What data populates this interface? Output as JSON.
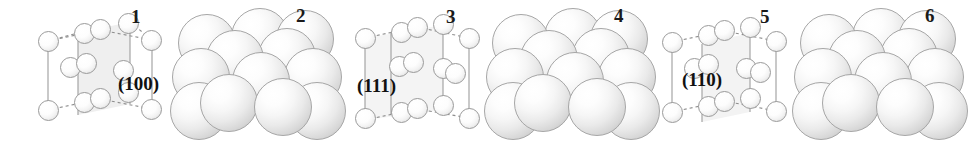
{
  "figure": {
    "background_color": "#ffffff",
    "width": 960,
    "height": 141
  },
  "style": {
    "atom_outline_color": "#9a9a9a",
    "sphere_outline_color": "#a6a6a6",
    "edge_solid_color": "#9d9d9d",
    "edge_dashed_color": "#8e8e8e",
    "plane_fill_color": "#e8e8e8",
    "label_color": "#1a1a1a"
  },
  "panels": [
    {
      "number": "1",
      "type": "ball-and-stick",
      "miller_label": "(100)",
      "label_x": 131,
      "label_y": 7,
      "miller_x": 118,
      "miller_y": 74,
      "origin_x": 30,
      "plane": "100"
    },
    {
      "number": "2",
      "type": "space-filling",
      "miller_label": "",
      "label_x": 296,
      "label_y": 6,
      "origin_x": 176,
      "plane": "100"
    },
    {
      "number": "3",
      "type": "ball-and-stick",
      "miller_label": "(111)",
      "label_x": 446,
      "label_y": 7,
      "miller_x": 357,
      "miller_y": 76,
      "origin_x": 345,
      "plane": "111"
    },
    {
      "number": "4",
      "type": "space-filling",
      "miller_label": "",
      "label_x": 614,
      "label_y": 6,
      "origin_x": 492,
      "plane": "111"
    },
    {
      "number": "5",
      "type": "ball-and-stick",
      "miller_label": "(110)",
      "label_x": 760,
      "label_y": 7,
      "miller_x": 682,
      "miller_y": 70,
      "origin_x": 658,
      "plane": "110"
    },
    {
      "number": "6",
      "type": "space-filling",
      "miller_label": "",
      "label_x": 925,
      "label_y": 6,
      "origin_x": 806,
      "plane": "110"
    }
  ]
}
